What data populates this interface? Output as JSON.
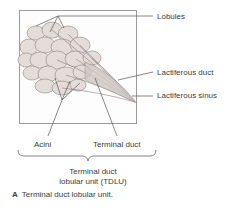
{
  "figure": {
    "title": "Terminal duct lobular unit",
    "labels": {
      "lobules": "Lobules",
      "lactiferous_duct": "Lactiferous duct",
      "lactiferous_sinus": "Lactiferous sinus",
      "acini": "Acini",
      "terminal_duct": "Terminal duct"
    },
    "bracket_label": {
      "line1": "Terminal duct",
      "line2": "lobular unit (TDLU)"
    },
    "caption": {
      "letter": "A",
      "text": "Terminal duct lobular unit."
    },
    "colors": {
      "lobule_fill": "#e4dcd8",
      "lobule_stroke": "#8c8480",
      "duct": "#8a8080",
      "leader_line": "#555555",
      "frame": "#9a9a9a"
    }
  }
}
